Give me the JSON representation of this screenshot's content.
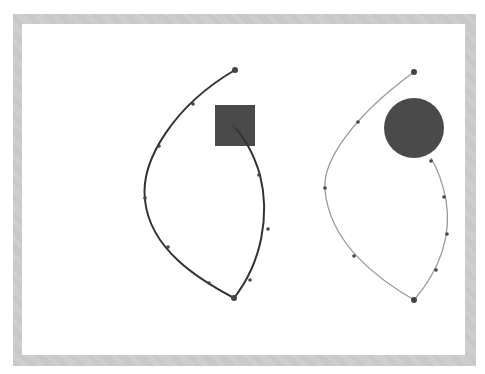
{
  "diagram": {
    "colors": {
      "frame": "#c9c9c9",
      "canvas": "#ffffff",
      "left_curve": "#333333",
      "right_curve": "#9a9a9a",
      "shape_fill": "#4a4a4a",
      "point": "#444444"
    },
    "left_path": {
      "stroke": "#333333",
      "stroke_width": 2,
      "d": "M235,70 C175,105 140,160 145,200 C150,250 200,280 234,298 C262,262 270,215 260,175 C252,148 242,136 234,126",
      "points": [
        [
          235,
          70
        ],
        [
          193,
          104
        ],
        [
          159,
          146
        ],
        [
          145,
          198
        ],
        [
          168,
          247
        ],
        [
          209,
          283
        ],
        [
          234,
          298
        ],
        [
          250,
          280
        ],
        [
          268,
          229
        ],
        [
          259,
          175
        ],
        [
          234,
          126
        ]
      ],
      "highlight_square": {
        "x": 215,
        "y": 105,
        "w": 40,
        "h": 41
      }
    },
    "right_path": {
      "stroke": "#9a9a9a",
      "stroke_width": 1.3,
      "d": "M414,72 C355,115 322,160 325,190 C330,245 380,280 414,300 C440,270 452,235 446,200 C442,180 437,168 431,158",
      "points": [
        [
          414,
          72
        ],
        [
          358,
          122
        ],
        [
          325,
          188
        ],
        [
          354,
          256
        ],
        [
          414,
          300
        ],
        [
          436,
          270
        ],
        [
          447,
          234
        ],
        [
          444,
          197
        ],
        [
          431,
          161
        ]
      ],
      "highlight_circle": {
        "cx": 414,
        "cy": 128,
        "r": 30
      }
    }
  }
}
